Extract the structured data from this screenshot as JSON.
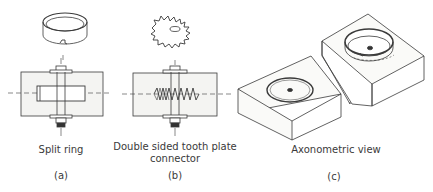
{
  "figure": {
    "panels": [
      {
        "id": "a",
        "label": "Split ring",
        "caption": "(a)"
      },
      {
        "id": "b",
        "label_line1": "Double sided tooth plate",
        "label_line2": "connector",
        "caption": "(b)"
      },
      {
        "id": "c",
        "label": "Axonometric view",
        "caption": "(c)"
      }
    ],
    "colors": {
      "line": "#3a3a3a",
      "wood": "#f4f4f2",
      "text": "#3a3a3a"
    }
  }
}
